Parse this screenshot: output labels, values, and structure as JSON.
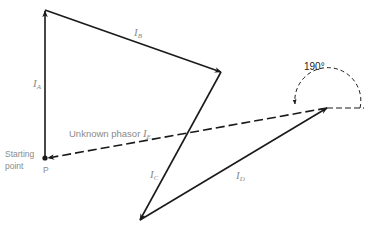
{
  "diagram": {
    "type": "phasor-polygon",
    "start_point": {
      "label": "P",
      "caption_line1": "Starting",
      "caption_line2": "point"
    },
    "phasors": [
      {
        "id": "IA",
        "symbol": "I",
        "subscript": "A",
        "from": [
          45,
          158
        ],
        "to": [
          45,
          10
        ]
      },
      {
        "id": "IB",
        "symbol": "I",
        "subscript": "B",
        "from": [
          45,
          10
        ],
        "to": [
          221,
          72
        ]
      },
      {
        "id": "IC",
        "symbol": "I",
        "subscript": "C",
        "from": [
          221,
          72
        ],
        "to": [
          140,
          220
        ]
      },
      {
        "id": "ID",
        "symbol": "I",
        "subscript": "D",
        "from": [
          140,
          220
        ],
        "to": [
          327,
          108
        ]
      }
    ],
    "unknown_phasor": {
      "label": "Unknown phasor ",
      "symbol": "I",
      "subscript": "E",
      "from": [
        327,
        108
      ],
      "to": [
        47,
        158
      ],
      "style": "dashed"
    },
    "angle": {
      "value": "190°",
      "center": [
        327,
        108
      ],
      "radius": 33
    },
    "colors": {
      "line": "#1a1a1a",
      "label": "#8a8a8a",
      "background": "#ffffff"
    }
  }
}
